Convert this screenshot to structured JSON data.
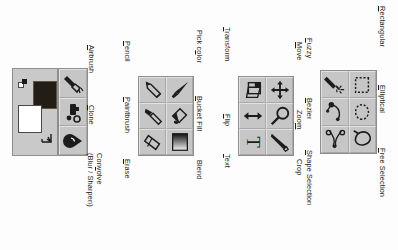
{
  "diagram": {
    "orientation_degrees": 90,
    "background_color": "#fdfdfd",
    "panel_color": "#c9c9c9",
    "button_color": "#c6c6c6",
    "border_color": "#8e8e8e"
  },
  "color_area": {
    "name": "color-swatch-area",
    "foreground_color": "#231d16",
    "background_color": "#ffffff",
    "swap_icon": "swap-colors-icon",
    "default_icon": "default-colors-icon"
  },
  "groups": [
    {
      "name": "selection-tools",
      "rows": [
        {
          "left": {
            "icon": "fuzzy-select-icon",
            "label": "Fuzzy",
            "mnemonic": "F",
            "rest": "uzzy"
          },
          "right": {
            "icon": "rectangular-select-icon",
            "label": "Rectangular",
            "mnemonic": "R",
            "rest": "ectangular"
          }
        },
        {
          "left": {
            "icon": "bezier-select-icon",
            "label": "Bezier",
            "mnemonic": "B",
            "rest": "ezier"
          },
          "right": {
            "icon": "elliptical-select-icon",
            "label": "Elliptical",
            "mnemonic": "E",
            "rest": "lliptical"
          }
        },
        {
          "left": {
            "icon": "shape-selection-icon",
            "label": "Shape Selection",
            "mnemonic": "S",
            "rest": "hape Selection"
          },
          "right": {
            "icon": "free-selection-icon",
            "label": "Free Selection",
            "mnemonic": "F",
            "rest": "ree Selection"
          }
        }
      ]
    },
    {
      "name": "transform-tools",
      "rows": [
        {
          "left": {
            "icon": "transform-icon",
            "label": "Transform",
            "mnemonic": "T",
            "rest": "ransform"
          },
          "right": {
            "icon": "move-icon",
            "label": "Move",
            "mnemonic": "M",
            "rest": "ove"
          }
        },
        {
          "left": {
            "icon": "flip-icon",
            "label": "Flip",
            "mnemonic": "F",
            "rest": "lip"
          },
          "right": {
            "icon": "zoom-icon",
            "label": "Zoom",
            "mnemonic": "m",
            "pre": "Zoo",
            "rest": ""
          }
        },
        {
          "left": {
            "icon": "text-icon",
            "label": "Text",
            "mnemonic": "T",
            "rest": "ext"
          },
          "right": {
            "icon": "crop-icon",
            "label": "Crop",
            "mnemonic": "",
            "rest": "Crop"
          }
        }
      ]
    },
    {
      "name": "paint-fill-tools",
      "rows": [
        {
          "left": {
            "icon": "pencil-icon",
            "label": "Pencil",
            "mnemonic": "P",
            "rest": "encil"
          },
          "right": {
            "icon": "pick-color-icon",
            "label": "Pick color",
            "mnemonic": "o",
            "pre": "Pick c",
            "rest": "lor"
          }
        },
        {
          "left": {
            "icon": "paintbrush-icon",
            "label": "Paintbrush",
            "mnemonic": "P",
            "rest": "aintbrush"
          },
          "right": {
            "icon": "bucket-fill-icon",
            "label": "Bucket Fill",
            "mnemonic": "B",
            "rest": "ucket Fill"
          }
        },
        {
          "left": {
            "icon": "erase-icon",
            "label": "Erase",
            "mnemonic": "E",
            "rest": "rase"
          },
          "right": {
            "icon": "blend-icon",
            "label": "Blend",
            "mnemonic": "",
            "rest": "Blend"
          }
        }
      ]
    },
    {
      "name": "brush-tools",
      "rows": [
        {
          "left": {
            "icon": "airbrush-icon",
            "label": "Airbrush",
            "mnemonic": "A",
            "rest": "irbrush"
          }
        },
        {
          "left": {
            "icon": "clone-icon",
            "label": "Clone",
            "mnemonic": "C",
            "rest": "lone"
          }
        },
        {
          "left": {
            "icon": "convolve-icon",
            "label": "Convolve",
            "label_line2": "(Blur / Sharpen)",
            "mnemonic": "v",
            "pre": "Con",
            "rest": "olve"
          }
        }
      ]
    }
  ]
}
